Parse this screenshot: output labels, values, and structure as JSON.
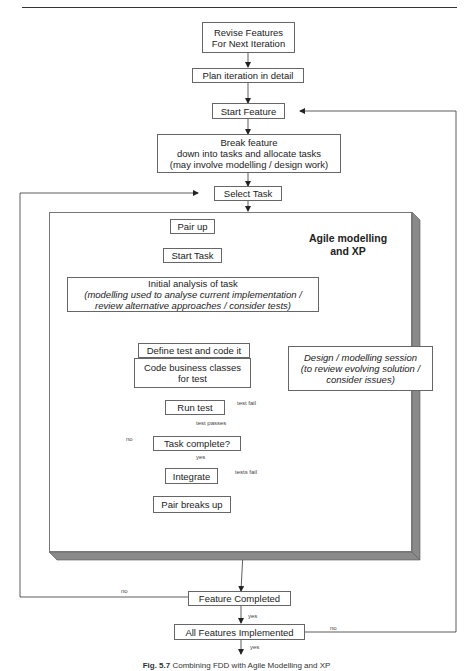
{
  "header": {
    "running_title": ""
  },
  "region": {
    "title_line1": "Agile modelling",
    "title_line2": "and XP"
  },
  "nodes": {
    "revise_features": {
      "line1": "Revise Features",
      "line2": "For Next Iteration"
    },
    "plan_iteration": {
      "label": "Plan iteration in detail"
    },
    "start_feature": {
      "label": "Start Feature"
    },
    "break_feature": {
      "line1": "Break feature",
      "line2": "down into tasks and allocate tasks",
      "line3": "(may involve modelling / design work)"
    },
    "select_task": {
      "label": "Select Task"
    },
    "pair_up": {
      "label": "Pair up"
    },
    "start_task": {
      "label": "Start Task"
    },
    "initial_analysis": {
      "line1": "Initial analysis of task",
      "line2": "(modelling used to analyse current implementation /",
      "line3": "review alternative approaches / consider tests)"
    },
    "define_test": {
      "label": "Define test and code it"
    },
    "design_session": {
      "line1": "Design / modelling session",
      "line2": "(to review evolving solution /",
      "line3": "consider issues)"
    },
    "code_business": {
      "line1": "Code business classes",
      "line2": "for test"
    },
    "run_test": {
      "label": "Run test"
    },
    "task_complete": {
      "label": "Task complete?"
    },
    "integrate": {
      "label": "Integrate"
    },
    "pair_breaks_up": {
      "label": "Pair breaks up"
    },
    "feature_completed": {
      "label": "Feature Completed"
    },
    "all_features": {
      "label": "All Features Implemented"
    }
  },
  "edge_labels": {
    "test_fail": "test fail",
    "test_passes": "test passes",
    "task_no": "no",
    "task_yes": "yes",
    "tests_fail": "tests fail",
    "feature_no": "no",
    "feature_yes": "yes",
    "all_no": "no",
    "all_yes": "yes"
  },
  "caption": {
    "prefix": "Fig. 5.7",
    "text": "Combining FDD with Agile Modelling and XP"
  }
}
